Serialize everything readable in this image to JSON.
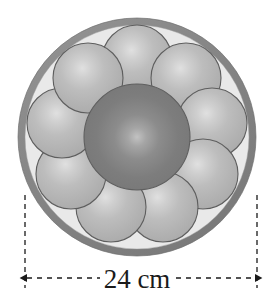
{
  "figure": {
    "type": "geometry-diagram",
    "dimension_label": "24 cm",
    "dimension_value": 24,
    "dimension_unit": "cm",
    "colors": {
      "outer_ring": "#8a8a8a",
      "outer_ring_dark": "#6f6f6f",
      "interior_background": "#e9e9e9",
      "center_sphere": "#7d7d7d",
      "center_sphere_highlight": "#b9b9b9",
      "center_sphere_outline": "#5f5f5f",
      "small_sphere": "#b5b5b5",
      "small_sphere_highlight": "#dcdcdc",
      "small_sphere_outline": "#5e5e5e",
      "dimension_line": "#1a1a1a",
      "label_text": "#1a1a1a",
      "page_background": "#ffffff"
    },
    "container_circle": {
      "name": "outer-container-circle",
      "cx": 137,
      "cy": 137,
      "outer_radius": 119,
      "inner_radius": 112,
      "ring_thickness": 7
    },
    "center_sphere": {
      "name": "center-sphere",
      "cx": 137,
      "cy": 137,
      "radius": 53,
      "count": 1
    },
    "small_spheres": {
      "name": "small-sphere-ring",
      "count": 9,
      "radius": 35,
      "ring_radius": 77,
      "start_angle_deg": -90,
      "positions": [
        {
          "index": 1,
          "cx": 137,
          "cy": 60
        },
        {
          "index": 2,
          "cx": 186,
          "cy": 78
        },
        {
          "index": 3,
          "cx": 212,
          "cy": 123
        },
        {
          "index": 4,
          "cx": 203,
          "cy": 174
        },
        {
          "index": 5,
          "cx": 163,
          "cy": 207
        },
        {
          "index": 6,
          "cx": 111,
          "cy": 207
        },
        {
          "index": 7,
          "cx": 71,
          "cy": 174
        },
        {
          "index": 8,
          "cx": 62,
          "cy": 123
        },
        {
          "index": 9,
          "cx": 88,
          "cy": 78
        }
      ]
    },
    "dimension": {
      "name": "width-dimension",
      "left_extension_x": 25,
      "right_extension_x": 257,
      "extension_top_y": 195,
      "extension_bottom_y": 288,
      "arrow_line_y": 278,
      "label_x": 137,
      "label_y": 287
    }
  }
}
